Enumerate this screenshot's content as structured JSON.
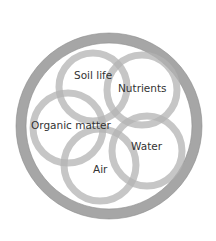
{
  "diagram": {
    "type": "overlapping-circles",
    "outer_ring": {
      "cx": 109,
      "cy": 126,
      "r": 88,
      "stroke_width": 10,
      "color": "#a6a6a6"
    },
    "ring_color": "#b3b3b3",
    "ring_opacity": 0.75,
    "ring_stroke_width": 7,
    "circles": [
      {
        "id": "soil-life",
        "label": "Soil life",
        "cx": 93,
        "cy": 87,
        "r": 34,
        "label_x": 74,
        "label_y": 79
      },
      {
        "id": "nutrients",
        "label": "Nutrients",
        "cx": 142,
        "cy": 90,
        "r": 35,
        "label_x": 118,
        "label_y": 92
      },
      {
        "id": "organic-matter",
        "label": "Organic matter",
        "cx": 68,
        "cy": 128,
        "r": 35,
        "label_x": 31,
        "label_y": 129
      },
      {
        "id": "air",
        "label": "Air",
        "cx": 100,
        "cy": 165,
        "r": 36,
        "label_x": 93,
        "label_y": 173
      },
      {
        "id": "water",
        "label": "Water",
        "cx": 147,
        "cy": 151,
        "r": 35,
        "label_x": 131,
        "label_y": 150
      }
    ]
  }
}
